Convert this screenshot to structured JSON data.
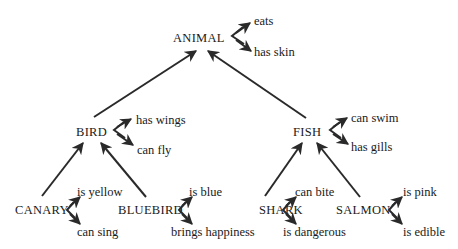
{
  "diagram": {
    "type": "semantic-network-hierarchy",
    "nodes": {
      "animal": {
        "label": "ANIMAL",
        "properties": [
          "eats",
          "has skin"
        ]
      },
      "bird": {
        "label": "BIRD",
        "properties": [
          "has wings",
          "can fly"
        ]
      },
      "fish": {
        "label": "FISH",
        "properties": [
          "can swim",
          "has gills"
        ]
      },
      "canary": {
        "label": "CANARY",
        "properties": [
          "is yellow",
          "can sing"
        ]
      },
      "bluebird": {
        "label": "BLUEBIRD",
        "properties": [
          "is blue",
          "brings happiness"
        ]
      },
      "shark": {
        "label": "SHARK",
        "properties": [
          "can bite",
          "is dangerous"
        ]
      },
      "salmon": {
        "label": "SALMON",
        "properties": [
          "is pink",
          "is edible"
        ]
      }
    },
    "edges": [
      {
        "from": "BIRD",
        "to": "ANIMAL"
      },
      {
        "from": "FISH",
        "to": "ANIMAL"
      },
      {
        "from": "CANARY",
        "to": "BIRD"
      },
      {
        "from": "BLUEBIRD",
        "to": "BIRD"
      },
      {
        "from": "SHARK",
        "to": "FISH"
      },
      {
        "from": "SALMON",
        "to": "FISH"
      }
    ],
    "colors": {
      "ink": "#1a1a1a",
      "background": "#ffffff"
    }
  }
}
